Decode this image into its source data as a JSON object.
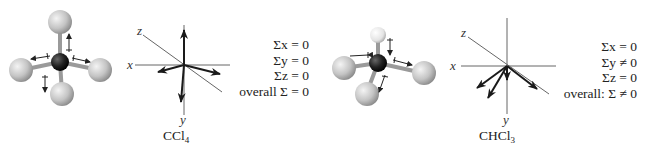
{
  "panels": [
    {
      "molecule": "CCl4",
      "label_main": "CCl",
      "label_sub": "4",
      "axes": [
        "x",
        "y",
        "z"
      ],
      "equations": {
        "sum_x": "Σx = 0",
        "sum_y": "Σy = 0",
        "sum_z": "Σz = 0",
        "overall": "overall Σ = 0"
      }
    },
    {
      "molecule": "CHCl3",
      "label_main": "CHCl",
      "label_sub": "3",
      "axes": [
        "x",
        "y",
        "z"
      ],
      "equations": {
        "sum_x": "Σx = 0",
        "sum_y": "Σy ≠ 0",
        "sum_z": "Σz = 0",
        "overall": "overall: Σ ≠ 0"
      }
    }
  ],
  "colors": {
    "chlorine_atom": "#c8c8c8",
    "carbon_atom": "#1e1e1e",
    "hydrogen_atom": "#eeeeee",
    "bond": "#9a9a9a",
    "axis": "#555555",
    "vector": "#1a1a1a"
  }
}
